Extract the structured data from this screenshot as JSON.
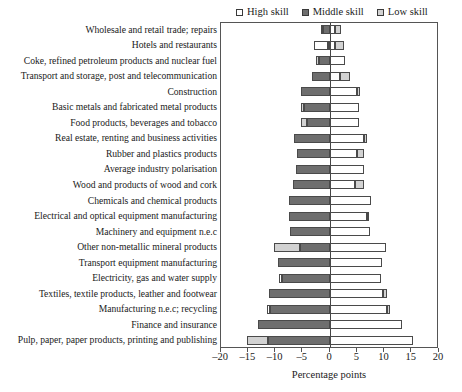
{
  "legend": {
    "position": "top-right",
    "entries": [
      {
        "label": "High skill",
        "key": "high",
        "color": "#ffffff",
        "swatch": "square-outline-icon"
      },
      {
        "label": "Middle skill",
        "key": "middle",
        "color": "#6e6e6e",
        "swatch": "square-filled-icon"
      },
      {
        "label": "Low skill",
        "key": "low",
        "color": "#d2d2d2",
        "swatch": "square-light-icon"
      }
    ]
  },
  "axis": {
    "x_title": "Percentage points",
    "x_ticks": [
      -20,
      -15,
      -10,
      -5,
      0,
      5,
      10,
      15,
      20
    ],
    "x_tick_labels": [
      "–20",
      "–15",
      "–10",
      "–5",
      "0",
      "5",
      "10",
      "15",
      "20"
    ],
    "xlim": [
      -20,
      20
    ],
    "grid": false
  },
  "chart_data": {
    "type": "bar",
    "orientation": "horizontal",
    "stacked": true,
    "diverging": true,
    "title": "",
    "subtitle": "",
    "xlabel": "Percentage points",
    "ylabel": "",
    "xlim": [
      -20,
      20
    ],
    "grid": false,
    "legend_position": "top-right",
    "categories": [
      "Wholesale and retail trade; repairs",
      "Hotels and restaurants",
      "Coke, refined petroleum products and nuclear fuel",
      "Transport and storage, post and telecommunication",
      "Construction",
      "Basic metals and fabricated metal products",
      "Food products, beverages and tobacco",
      "Real estate, renting and business activities",
      "Rubber and plastics products",
      "Average industry polarisation",
      "Wood and products of wood and cork",
      "Chemicals and chemical products",
      "Electrical and optical equipment manufacturing",
      "Machinery and equipment n.e.c",
      "Other non-metallic mineral products",
      "Transport equipment manufacturing",
      "Electricity, gas and water supply",
      "Textiles, textile products, leather and footwear",
      "Manufacturing n.e.c; recycling",
      "Finance and insurance",
      "Pulp, paper, paper products, printing and publishing"
    ],
    "series": [
      {
        "name": "Middle skill",
        "color": "#6e6e6e",
        "values": [
          -1.3,
          -0.3,
          -2.0,
          -3.3,
          -5.4,
          -4.8,
          -4.3,
          -6.6,
          -6.1,
          -6.3,
          -6.7,
          -7.6,
          -7.6,
          -7.4,
          -5.5,
          -9.6,
          -8.8,
          -11.2,
          -11.0,
          -13.3,
          -11.3
        ]
      },
      {
        "name": "Low skill",
        "color": "#d2d2d2",
        "values": [
          -0.3,
          0.0,
          -0.6,
          0.0,
          0.0,
          -0.5,
          -1.0,
          0.0,
          0.0,
          0.0,
          0.0,
          0.0,
          0.0,
          0.0,
          -4.8,
          0.0,
          -0.5,
          0.0,
          0.0,
          0.0,
          -4.0
        ]
      },
      {
        "name": "High skill",
        "color": "#ffffff",
        "values": [
          1.1,
          2.5,
          2.7,
          2.7,
          5.4,
          5.3,
          5.3,
          6.6,
          5.3,
          6.3,
          6.2,
          7.6,
          7.2,
          7.4,
          10.3,
          9.6,
          9.3,
          10.4,
          11.0,
          13.3,
          15.3
        ]
      }
    ],
    "positive_side_segments": [
      {
        "category_index": 0,
        "segments": [
          {
            "skill": "high",
            "from": 0.0,
            "to": 0.9
          },
          {
            "skill": "low",
            "from": 0.9,
            "to": 2.0
          }
        ]
      },
      {
        "category_index": 1,
        "segments": [
          {
            "skill": "high",
            "from": 0.0,
            "to": 1.0
          },
          {
            "skill": "low",
            "from": 1.0,
            "to": 2.6
          }
        ]
      },
      {
        "category_index": 2,
        "segments": [
          {
            "skill": "high",
            "from": 0.0,
            "to": 2.7
          }
        ]
      },
      {
        "category_index": 3,
        "segments": [
          {
            "skill": "high",
            "from": 0.0,
            "to": 1.8
          },
          {
            "skill": "low",
            "from": 1.8,
            "to": 3.6
          }
        ]
      },
      {
        "category_index": 4,
        "segments": [
          {
            "skill": "high",
            "from": 0.0,
            "to": 5.0
          },
          {
            "skill": "low",
            "from": 5.0,
            "to": 5.5
          }
        ]
      },
      {
        "category_index": 5,
        "segments": [
          {
            "skill": "high",
            "from": 0.0,
            "to": 5.3
          }
        ]
      },
      {
        "category_index": 6,
        "segments": [
          {
            "skill": "high",
            "from": 0.0,
            "to": 5.3
          }
        ]
      },
      {
        "category_index": 7,
        "segments": [
          {
            "skill": "high",
            "from": 0.0,
            "to": 6.3
          },
          {
            "skill": "low",
            "from": 6.3,
            "to": 6.8
          }
        ]
      },
      {
        "category_index": 8,
        "segments": [
          {
            "skill": "high",
            "from": 0.0,
            "to": 5.0
          },
          {
            "skill": "low",
            "from": 5.0,
            "to": 6.3
          }
        ]
      },
      {
        "category_index": 9,
        "segments": [
          {
            "skill": "high",
            "from": 0.0,
            "to": 6.3
          }
        ]
      },
      {
        "category_index": 10,
        "segments": [
          {
            "skill": "high",
            "from": 0.0,
            "to": 4.6
          },
          {
            "skill": "low",
            "from": 4.6,
            "to": 6.2
          }
        ]
      },
      {
        "category_index": 11,
        "segments": [
          {
            "skill": "high",
            "from": 0.0,
            "to": 7.6
          }
        ]
      },
      {
        "category_index": 12,
        "segments": [
          {
            "skill": "high",
            "from": 0.0,
            "to": 6.7
          },
          {
            "skill": "low",
            "from": 6.7,
            "to": 7.2
          }
        ]
      },
      {
        "category_index": 13,
        "segments": [
          {
            "skill": "high",
            "from": 0.0,
            "to": 7.4
          }
        ]
      },
      {
        "category_index": 14,
        "segments": [
          {
            "skill": "high",
            "from": 0.0,
            "to": 10.3
          }
        ]
      },
      {
        "category_index": 15,
        "segments": [
          {
            "skill": "high",
            "from": 0.0,
            "to": 9.6
          }
        ]
      },
      {
        "category_index": 16,
        "segments": [
          {
            "skill": "high",
            "from": 0.0,
            "to": 9.3
          }
        ]
      },
      {
        "category_index": 17,
        "segments": [
          {
            "skill": "high",
            "from": 0.0,
            "to": 9.8
          },
          {
            "skill": "low",
            "from": 9.8,
            "to": 10.4
          }
        ]
      },
      {
        "category_index": 18,
        "segments": [
          {
            "skill": "high",
            "from": 0.0,
            "to": 10.5
          },
          {
            "skill": "low",
            "from": 10.5,
            "to": 11.0
          }
        ]
      },
      {
        "category_index": 19,
        "segments": [
          {
            "skill": "high",
            "from": 0.0,
            "to": 13.3
          }
        ]
      },
      {
        "category_index": 20,
        "segments": [
          {
            "skill": "high",
            "from": 0.0,
            "to": 15.3
          }
        ]
      }
    ],
    "negative_side_segments": [
      {
        "category_index": 0,
        "segments": [
          {
            "skill": "middle",
            "from": -1.3,
            "to": 0.0
          },
          {
            "skill": "low",
            "from": -1.6,
            "to": -1.3
          }
        ]
      },
      {
        "category_index": 1,
        "segments": [
          {
            "skill": "middle",
            "from": -0.4,
            "to": 0.0
          },
          {
            "skill": "high",
            "from": -3.0,
            "to": -0.4
          }
        ]
      },
      {
        "category_index": 2,
        "segments": [
          {
            "skill": "middle",
            "from": -2.0,
            "to": 0.0
          },
          {
            "skill": "low",
            "from": -2.6,
            "to": -2.0
          }
        ]
      },
      {
        "category_index": 3,
        "segments": [
          {
            "skill": "middle",
            "from": -3.3,
            "to": 0.0
          }
        ]
      },
      {
        "category_index": 4,
        "segments": [
          {
            "skill": "middle",
            "from": -5.4,
            "to": 0.0
          }
        ]
      },
      {
        "category_index": 5,
        "segments": [
          {
            "skill": "middle",
            "from": -4.8,
            "to": 0.0
          },
          {
            "skill": "low",
            "from": -5.3,
            "to": -4.8
          }
        ]
      },
      {
        "category_index": 6,
        "segments": [
          {
            "skill": "middle",
            "from": -4.3,
            "to": 0.0
          },
          {
            "skill": "low",
            "from": -5.3,
            "to": -4.3
          }
        ]
      },
      {
        "category_index": 7,
        "segments": [
          {
            "skill": "middle",
            "from": -6.6,
            "to": 0.0
          }
        ]
      },
      {
        "category_index": 8,
        "segments": [
          {
            "skill": "middle",
            "from": -6.1,
            "to": 0.0
          }
        ]
      },
      {
        "category_index": 9,
        "segments": [
          {
            "skill": "middle",
            "from": -6.3,
            "to": 0.0
          }
        ]
      },
      {
        "category_index": 10,
        "segments": [
          {
            "skill": "middle",
            "from": -6.7,
            "to": 0.0
          }
        ]
      },
      {
        "category_index": 11,
        "segments": [
          {
            "skill": "middle",
            "from": -7.6,
            "to": 0.0
          }
        ]
      },
      {
        "category_index": 12,
        "segments": [
          {
            "skill": "middle",
            "from": -7.6,
            "to": 0.0
          }
        ]
      },
      {
        "category_index": 13,
        "segments": [
          {
            "skill": "middle",
            "from": -7.4,
            "to": 0.0
          }
        ]
      },
      {
        "category_index": 14,
        "segments": [
          {
            "skill": "middle",
            "from": -5.5,
            "to": 0.0
          },
          {
            "skill": "low",
            "from": -10.3,
            "to": -5.5
          }
        ]
      },
      {
        "category_index": 15,
        "segments": [
          {
            "skill": "middle",
            "from": -9.6,
            "to": 0.0
          }
        ]
      },
      {
        "category_index": 16,
        "segments": [
          {
            "skill": "middle",
            "from": -8.8,
            "to": 0.0
          },
          {
            "skill": "high",
            "from": -9.3,
            "to": -8.8
          }
        ]
      },
      {
        "category_index": 17,
        "segments": [
          {
            "skill": "middle",
            "from": -11.2,
            "to": 0.0
          }
        ]
      },
      {
        "category_index": 18,
        "segments": [
          {
            "skill": "middle",
            "from": -11.0,
            "to": 0.0
          },
          {
            "skill": "high",
            "from": -11.6,
            "to": -11.0
          }
        ]
      },
      {
        "category_index": 19,
        "segments": [
          {
            "skill": "middle",
            "from": -13.3,
            "to": 0.0
          }
        ]
      },
      {
        "category_index": 20,
        "segments": [
          {
            "skill": "middle",
            "from": -11.3,
            "to": 0.0
          },
          {
            "skill": "low",
            "from": -15.3,
            "to": -11.3
          }
        ]
      }
    ]
  }
}
